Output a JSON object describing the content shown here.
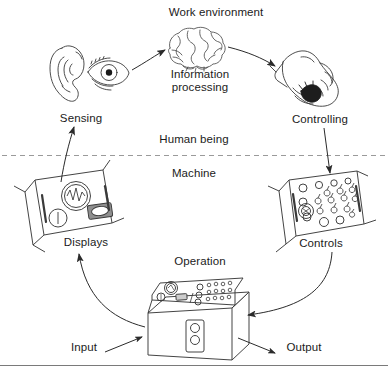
{
  "diagram": {
    "labels": {
      "work_environment": "Work environment",
      "information_processing_line1": "Information",
      "information_processing_line2": "processing",
      "sensing": "Sensing",
      "controlling": "Controlling",
      "human_being": "Human being",
      "machine": "Machine",
      "displays": "Displays",
      "controls": "Controls",
      "operation": "Operation",
      "input": "Input",
      "output": "Output"
    },
    "icons": {
      "brain": "brain-icon",
      "ear": "ear-icon",
      "eye": "eye-icon",
      "hand": "hand-icon",
      "displays_panel": "displays-panel-icon",
      "controls_panel": "controls-panel-icon",
      "machine_console": "machine-console-icon"
    },
    "colors": {
      "stroke": "#333333",
      "text": "#1b1b1b",
      "divider": "#999999",
      "background": "#ffffff",
      "fill_dark": "#1a1a1a"
    },
    "divider": {
      "style": "dashed",
      "y": 155,
      "above_label": "Human being",
      "below_label": "Machine"
    },
    "flow": [
      {
        "from": "Sensing",
        "to": "Information processing"
      },
      {
        "from": "Information processing",
        "to": "Controlling"
      },
      {
        "from": "Controlling",
        "to": "Controls"
      },
      {
        "from": "Controls",
        "to": "Operation"
      },
      {
        "from": "Operation",
        "to": "Displays"
      },
      {
        "from": "Displays",
        "to": "Sensing"
      },
      {
        "from": "Input",
        "to": "Operation"
      },
      {
        "from": "Operation",
        "to": "Output"
      }
    ]
  }
}
